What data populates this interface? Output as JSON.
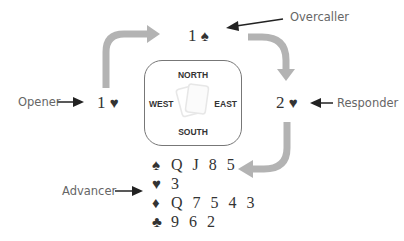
{
  "diagram": {
    "table": {
      "north": "NORTH",
      "south": "SOUTH",
      "east": "EAST",
      "west": "WEST"
    },
    "bids": {
      "opener": {
        "level": "1",
        "suit": "♥"
      },
      "overcaller": {
        "level": "1",
        "suit": "♠"
      },
      "responder": {
        "level": "2",
        "suit": "♥"
      }
    },
    "labels": {
      "opener": "Opener",
      "overcaller": "Overcaller",
      "responder": "Responder",
      "advancer": "Advancer"
    },
    "advancer_hand": [
      {
        "suit": "♠",
        "cards": "Q J 8 5"
      },
      {
        "suit": "♥",
        "cards": "3"
      },
      {
        "suit": "♦",
        "cards": "Q 7 5 4 3"
      },
      {
        "suit": "♣",
        "cards": "9 6 2"
      }
    ],
    "colors": {
      "flow_arrow": "#b3b3b3",
      "pointer_arrow": "#222222",
      "text": "#333333",
      "label_text": "#666666"
    }
  }
}
